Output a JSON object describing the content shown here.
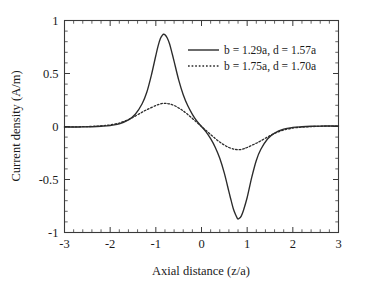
{
  "chart_data": {
    "type": "line",
    "title": "",
    "xlabel": "Axial distance (z/a)",
    "ylabel": "Current density  (A/m)",
    "xlim": [
      -3,
      3
    ],
    "ylim": [
      -1,
      1
    ],
    "xticks": [
      -3,
      -2,
      -1,
      0,
      1,
      2,
      3
    ],
    "xticklabels": [
      "-3",
      "-2",
      "-1",
      "0",
      "1",
      "2",
      "3"
    ],
    "yticks": [
      -1,
      -0.5,
      0,
      0.5,
      1
    ],
    "yticklabels": [
      "-1",
      "-0.5",
      "0",
      "0.5",
      "1"
    ],
    "xminor_per_interval": 5,
    "yminor_per_interval": 5,
    "grid": false,
    "legend_position": "upper-right-inside",
    "series": [
      {
        "name": "b = 1.29a, d = 1.57a",
        "style": "solid",
        "color": "#2b2b2b",
        "peak": {
          "x": -0.83,
          "y": 0.87
        },
        "trough": {
          "x": 0.79,
          "y": -0.87
        },
        "x": [
          -3.0,
          -2.8,
          -2.6,
          -2.4,
          -2.2,
          -2.0,
          -1.8,
          -1.6,
          -1.45,
          -1.3,
          -1.2,
          -1.1,
          -1.0,
          -0.95,
          -0.9,
          -0.85,
          -0.83,
          -0.8,
          -0.75,
          -0.7,
          -0.65,
          -0.6,
          -0.5,
          -0.4,
          -0.3,
          -0.2,
          -0.1,
          0.0,
          0.1,
          0.2,
          0.3,
          0.4,
          0.5,
          0.6,
          0.65,
          0.7,
          0.75,
          0.79,
          0.82,
          0.87,
          0.92,
          1.0,
          1.1,
          1.2,
          1.3,
          1.45,
          1.6,
          1.8,
          2.0,
          2.2,
          2.4,
          2.6,
          2.8,
          3.0
        ],
        "y": [
          -0.005,
          -0.005,
          -0.004,
          -0.002,
          0.002,
          0.009,
          0.025,
          0.062,
          0.115,
          0.215,
          0.32,
          0.48,
          0.67,
          0.76,
          0.83,
          0.865,
          0.87,
          0.865,
          0.835,
          0.78,
          0.7,
          0.615,
          0.44,
          0.3,
          0.195,
          0.115,
          0.05,
          0.0,
          -0.05,
          -0.115,
          -0.195,
          -0.3,
          -0.44,
          -0.615,
          -0.7,
          -0.78,
          -0.835,
          -0.87,
          -0.868,
          -0.845,
          -0.79,
          -0.67,
          -0.48,
          -0.32,
          -0.215,
          -0.115,
          -0.062,
          -0.025,
          -0.009,
          -0.002,
          0.002,
          0.004,
          0.005,
          0.005
        ]
      },
      {
        "name": "b = 1.75a, d = 1.70a",
        "style": "dotted",
        "color": "#2b2b2b",
        "peak": {
          "x": -0.85,
          "y": 0.22
        },
        "trough": {
          "x": 0.85,
          "y": -0.22
        },
        "x": [
          -3.0,
          -2.8,
          -2.6,
          -2.4,
          -2.2,
          -2.0,
          -1.8,
          -1.6,
          -1.45,
          -1.3,
          -1.2,
          -1.1,
          -1.0,
          -0.95,
          -0.9,
          -0.85,
          -0.8,
          -0.75,
          -0.7,
          -0.6,
          -0.5,
          -0.4,
          -0.3,
          -0.2,
          -0.1,
          0.0,
          0.1,
          0.2,
          0.3,
          0.4,
          0.5,
          0.6,
          0.7,
          0.75,
          0.8,
          0.85,
          0.9,
          0.95,
          1.0,
          1.1,
          1.2,
          1.3,
          1.45,
          1.6,
          1.8,
          2.0,
          2.2,
          2.4,
          2.6,
          2.8,
          3.0
        ],
        "y": [
          -0.004,
          -0.004,
          -0.002,
          0.001,
          0.006,
          0.015,
          0.033,
          0.065,
          0.098,
          0.135,
          0.158,
          0.178,
          0.198,
          0.206,
          0.213,
          0.218,
          0.219,
          0.217,
          0.213,
          0.198,
          0.175,
          0.147,
          0.113,
          0.076,
          0.038,
          0.0,
          -0.038,
          -0.076,
          -0.113,
          -0.147,
          -0.175,
          -0.198,
          -0.213,
          -0.217,
          -0.219,
          -0.218,
          -0.213,
          -0.206,
          -0.198,
          -0.178,
          -0.158,
          -0.135,
          -0.098,
          -0.065,
          -0.033,
          -0.015,
          -0.006,
          -0.001,
          0.002,
          0.004,
          0.004
        ]
      }
    ]
  }
}
